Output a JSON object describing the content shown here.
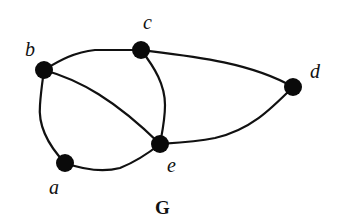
{
  "graph": {
    "title": "G",
    "nodes": [
      {
        "id": "a",
        "label": "a",
        "x": 65,
        "y": 163
      },
      {
        "id": "b",
        "label": "b",
        "x": 44,
        "y": 70
      },
      {
        "id": "c",
        "label": "c",
        "x": 141,
        "y": 50
      },
      {
        "id": "d",
        "label": "d",
        "x": 293,
        "y": 87
      },
      {
        "id": "e",
        "label": "e",
        "x": 160,
        "y": 144
      }
    ],
    "edges": [
      {
        "from": "a",
        "to": "b"
      },
      {
        "from": "a",
        "to": "e"
      },
      {
        "from": "b",
        "to": "c"
      },
      {
        "from": "b",
        "to": "e"
      },
      {
        "from": "c",
        "to": "e"
      },
      {
        "from": "c",
        "to": "d"
      },
      {
        "from": "d",
        "to": "e"
      }
    ]
  }
}
